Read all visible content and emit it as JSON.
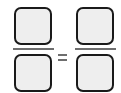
{
  "equation": {
    "left_fraction": {
      "numerator": "",
      "denominator": ""
    },
    "operator": "=",
    "right_fraction": {
      "numerator": "",
      "denominator": ""
    }
  },
  "colors": {
    "box_fill": "#eeeeee",
    "box_border": "#1a1a1a",
    "fraction_bar": "#6e6e6e"
  }
}
